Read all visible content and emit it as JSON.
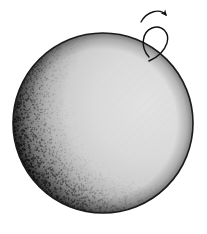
{
  "figure": {
    "title": "Illuminated rotating sphere",
    "subject": "sphere",
    "background_color": "#ffffff",
    "width": 207,
    "height": 234,
    "style": "stippled halftone line-art"
  },
  "sphere": {
    "name": "sphere-body",
    "center_x": 103,
    "center_y": 123,
    "radius": 90,
    "outline_color": "#1a1a1a",
    "outline_width": 1.6,
    "lit_color": "#d9d9d9",
    "shadow_color": "#111111",
    "midtone_color": "#6e6e6e",
    "terminator_label": "",
    "lighting": {
      "light_from": "right",
      "phase": "gibbous",
      "highlight_x": 140,
      "highlight_y": 95
    }
  },
  "rotation_arrow": {
    "name": "rotation-arrow",
    "label": "",
    "stroke_color": "#111111",
    "stroke_width": 1.4,
    "arrowhead_x": 167,
    "arrowhead_y": 27,
    "direction": "clockwise-about-vertical-axis",
    "axis_loop": {
      "cx": 155,
      "cy": 40,
      "rx": 12,
      "ry": 16,
      "rotation_deg": -22
    }
  },
  "stipple": {
    "seed": 20240607,
    "dot_count": 7200,
    "dot_radius_min": 0.35,
    "dot_radius_max": 0.95,
    "dot_color": "#0c0c0c"
  },
  "texture": {
    "hatch_color": "#cfcfcf",
    "hatch_spacing": 7,
    "hatch_angle_deg": 45,
    "hatch_opacity": 0.55
  }
}
